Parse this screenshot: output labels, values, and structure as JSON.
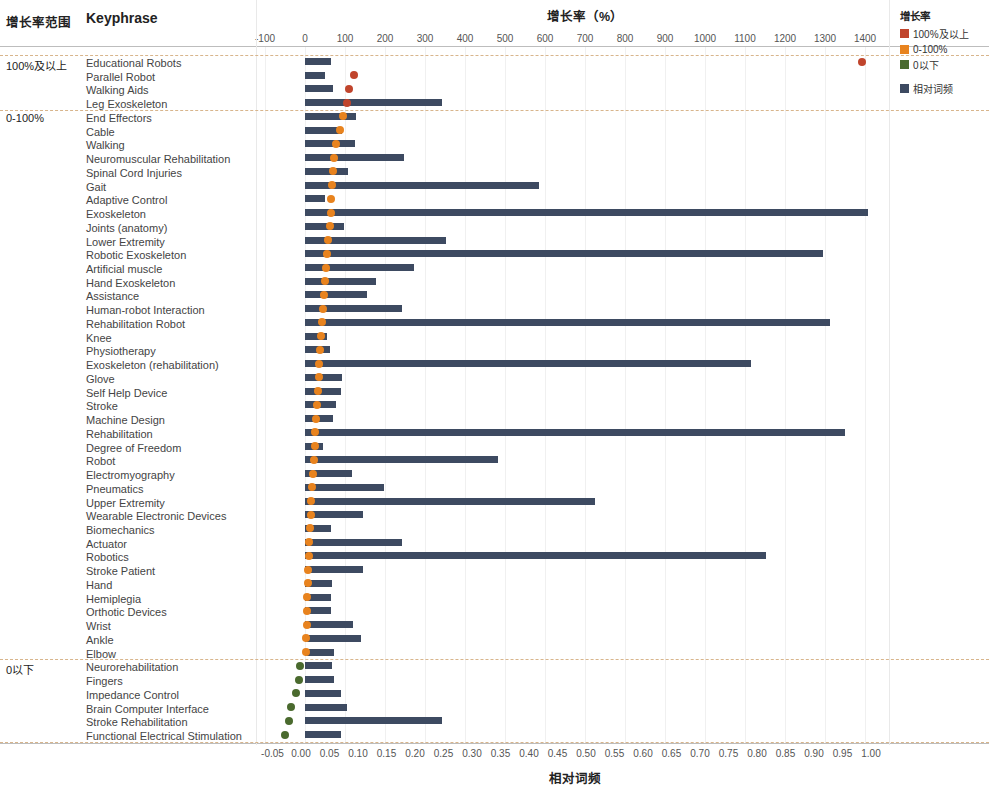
{
  "headers": {
    "range_column": "增长率范围",
    "keyphrase_column": "Keyphrase",
    "growth_axis_title": "增长率（%）",
    "freq_axis_title": "相对词频"
  },
  "legend": {
    "title": "增长率",
    "items": [
      {
        "label": "100%及以上",
        "color": "#C0442C"
      },
      {
        "label": "0-100%",
        "color": "#E8831E"
      },
      {
        "label": "0以下",
        "color": "#4A6A2E"
      }
    ],
    "bar_item": {
      "label": "相对词频",
      "color": "#3D4A61"
    }
  },
  "chart_data": {
    "type": "bar",
    "title": "增长率（%）",
    "xlabel": "增长率（%）",
    "ylabel": "Keyphrase",
    "secondary_xlabel": "相对词频",
    "grid": true,
    "legend_position": "top-right",
    "top_axis": {
      "label": "增长率（%）",
      "ticks": [
        -100,
        0,
        100,
        200,
        300,
        400,
        500,
        600,
        700,
        800,
        900,
        1000,
        1100,
        1200,
        1300,
        1400
      ],
      "range": [
        -100,
        1400
      ]
    },
    "bottom_axis": {
      "label": "相对词频",
      "ticks": [
        "-0.05",
        "0.00",
        "0.05",
        "0.10",
        "0.15",
        "0.20",
        "0.25",
        "0.30",
        "0.35",
        "0.40",
        "0.45",
        "0.50",
        "0.55",
        "0.60",
        "0.65",
        "0.70",
        "0.75",
        "0.80",
        "0.85",
        "0.90",
        "0.95",
        "1.00"
      ],
      "range": [
        -0.05,
        1.0
      ]
    },
    "groups": [
      {
        "label": "100%及以上",
        "start_index": 0,
        "count": 4
      },
      {
        "label": "0-100%",
        "start_index": 4,
        "count": 40
      },
      {
        "label": "0以下",
        "start_index": 44,
        "count": 6
      }
    ],
    "series": [
      {
        "name": "相对词频",
        "type": "bar",
        "color": "#3D4A61"
      },
      {
        "name": "增长率",
        "type": "scatter"
      }
    ],
    "categories": [
      "Educational Robots",
      "Parallel Robot",
      "Walking Aids",
      "Leg Exoskeleton",
      "End Effectors",
      "Cable",
      "Walking",
      "Neuromuscular Rehabilitation",
      "Spinal Cord Injuries",
      "Gait",
      "Adaptive Control",
      "Exoskeleton",
      "Joints (anatomy)",
      "Lower Extremity",
      "Robotic Exoskeleton",
      "Artificial muscle",
      "Hand Exoskeleton",
      "Assistance",
      "Human-robot Interaction",
      "Rehabilitation Robot",
      "Knee",
      "Physiotherapy",
      "Exoskeleton (rehabilitation)",
      "Glove",
      "Self Help Device",
      "Stroke",
      "Machine Design",
      "Rehabilitation",
      "Degree of Freedom",
      "Robot",
      "Electromyography",
      "Pneumatics",
      "Upper Extremity",
      "Wearable Electronic Devices",
      "Biomechanics",
      "Actuator",
      "Robotics",
      "Stroke Patient",
      "Hand",
      "Hemiplegia",
      "Orthotic Devices",
      "Wrist",
      "Ankle",
      "Elbow",
      "Neurorehabilitation",
      "Fingers",
      "Impedance Control",
      "Brain Computer Interface",
      "Stroke Rehabilitation",
      "Functional Electrical Stimulation"
    ],
    "rows": [
      {
        "keyphrase": "Educational Robots",
        "group": "100%及以上",
        "freq": 0.052,
        "growth": 1393,
        "dot_color": "#C0442C"
      },
      {
        "keyphrase": "Parallel Robot",
        "group": "100%及以上",
        "freq": 0.042,
        "growth": 123,
        "dot_color": "#C0442C"
      },
      {
        "keyphrase": "Walking Aids",
        "group": "100%及以上",
        "freq": 0.056,
        "growth": 111,
        "dot_color": "#C0442C"
      },
      {
        "keyphrase": "Leg Exoskeleton",
        "group": "100%及以上",
        "freq": 0.247,
        "growth": 106,
        "dot_color": "#C0442C"
      },
      {
        "keyphrase": "End Effectors",
        "group": "0-100%",
        "freq": 0.097,
        "growth": 95,
        "dot_color": "#E8831E"
      },
      {
        "keyphrase": "Cable",
        "group": "0-100%",
        "freq": 0.072,
        "growth": 87,
        "dot_color": "#E8831E"
      },
      {
        "keyphrase": "Walking",
        "group": "0-100%",
        "freq": 0.095,
        "growth": 78,
        "dot_color": "#E8831E"
      },
      {
        "keyphrase": "Neuromuscular Rehabilitation",
        "group": "0-100%",
        "freq": 0.18,
        "growth": 73,
        "dot_color": "#E8831E"
      },
      {
        "keyphrase": "Spinal Cord Injuries",
        "group": "0-100%",
        "freq": 0.082,
        "growth": 70,
        "dot_color": "#E8831E"
      },
      {
        "keyphrase": "Gait",
        "group": "0-100%",
        "freq": 0.418,
        "growth": 68,
        "dot_color": "#E8831E"
      },
      {
        "keyphrase": "Adaptive Control",
        "group": "0-100%",
        "freq": 0.042,
        "growth": 66,
        "dot_color": "#E8831E"
      },
      {
        "keyphrase": "Exoskeleton",
        "group": "0-100%",
        "freq": 0.995,
        "growth": 64,
        "dot_color": "#E8831E"
      },
      {
        "keyphrase": "Joints (anatomy)",
        "group": "0-100%",
        "freq": 0.075,
        "growth": 62,
        "dot_color": "#E8831E"
      },
      {
        "keyphrase": "Lower Extremity",
        "group": "0-100%",
        "freq": 0.255,
        "growth": 58,
        "dot_color": "#E8831E"
      },
      {
        "keyphrase": "Robotic Exoskeleton",
        "group": "0-100%",
        "freq": 0.915,
        "growth": 56,
        "dot_color": "#E8831E"
      },
      {
        "keyphrase": "Artificial muscle",
        "group": "0-100%",
        "freq": 0.198,
        "growth": 53,
        "dot_color": "#E8831E"
      },
      {
        "keyphrase": "Hand Exoskeleton",
        "group": "0-100%",
        "freq": 0.132,
        "growth": 50,
        "dot_color": "#E8831E"
      },
      {
        "keyphrase": "Assistance",
        "group": "0-100%",
        "freq": 0.116,
        "growth": 47,
        "dot_color": "#E8831E"
      },
      {
        "keyphrase": "Human-robot Interaction",
        "group": "0-100%",
        "freq": 0.177,
        "growth": 44,
        "dot_color": "#E8831E"
      },
      {
        "keyphrase": "Rehabilitation Robot",
        "group": "0-100%",
        "freq": 0.928,
        "growth": 42,
        "dot_color": "#E8831E"
      },
      {
        "keyphrase": "Knee",
        "group": "0-100%",
        "freq": 0.045,
        "growth": 40,
        "dot_color": "#E8831E"
      },
      {
        "keyphrase": "Physiotherapy",
        "group": "0-100%",
        "freq": 0.05,
        "growth": 38,
        "dot_color": "#E8831E"
      },
      {
        "keyphrase": "Exoskeleton (rehabilitation)",
        "group": "0-100%",
        "freq": 0.79,
        "growth": 36,
        "dot_color": "#E8831E"
      },
      {
        "keyphrase": "Glove",
        "group": "0-100%",
        "freq": 0.072,
        "growth": 34,
        "dot_color": "#E8831E"
      },
      {
        "keyphrase": "Self Help Device",
        "group": "0-100%",
        "freq": 0.07,
        "growth": 32,
        "dot_color": "#E8831E"
      },
      {
        "keyphrase": "Stroke",
        "group": "0-100%",
        "freq": 0.061,
        "growth": 30,
        "dot_color": "#E8831E"
      },
      {
        "keyphrase": "Machine Design",
        "group": "0-100%",
        "freq": 0.057,
        "growth": 28,
        "dot_color": "#E8831E"
      },
      {
        "keyphrase": "Rehabilitation",
        "group": "0-100%",
        "freq": 0.955,
        "growth": 26,
        "dot_color": "#E8831E"
      },
      {
        "keyphrase": "Degree of Freedom",
        "group": "0-100%",
        "freq": 0.038,
        "growth": 24,
        "dot_color": "#E8831E"
      },
      {
        "keyphrase": "Robot",
        "group": "0-100%",
        "freq": 0.345,
        "growth": 22,
        "dot_color": "#E8831E"
      },
      {
        "keyphrase": "Electromyography",
        "group": "0-100%",
        "freq": 0.09,
        "growth": 20,
        "dot_color": "#E8831E"
      },
      {
        "keyphrase": "Pneumatics",
        "group": "0-100%",
        "freq": 0.145,
        "growth": 18,
        "dot_color": "#E8831E"
      },
      {
        "keyphrase": "Upper Extremity",
        "group": "0-100%",
        "freq": 0.515,
        "growth": 16,
        "dot_color": "#E8831E"
      },
      {
        "keyphrase": "Wearable Electronic Devices",
        "group": "0-100%",
        "freq": 0.108,
        "growth": 14,
        "dot_color": "#E8831E"
      },
      {
        "keyphrase": "Biomechanics",
        "group": "0-100%",
        "freq": 0.052,
        "growth": 12,
        "dot_color": "#E8831E"
      },
      {
        "keyphrase": "Actuator",
        "group": "0-100%",
        "freq": 0.178,
        "growth": 10,
        "dot_color": "#E8831E"
      },
      {
        "keyphrase": "Robotics",
        "group": "0-100%",
        "freq": 0.815,
        "growth": 9,
        "dot_color": "#E8831E"
      },
      {
        "keyphrase": "Stroke Patient",
        "group": "0-100%",
        "freq": 0.108,
        "growth": 8,
        "dot_color": "#E8831E"
      },
      {
        "keyphrase": "Hand",
        "group": "0-100%",
        "freq": 0.055,
        "growth": 7,
        "dot_color": "#E8831E"
      },
      {
        "keyphrase": "Hemiplegia",
        "group": "0-100%",
        "freq": 0.052,
        "growth": 6,
        "dot_color": "#E8831E"
      },
      {
        "keyphrase": "Orthotic Devices",
        "group": "0-100%",
        "freq": 0.053,
        "growth": 5,
        "dot_color": "#E8831E"
      },
      {
        "keyphrase": "Wrist",
        "group": "0-100%",
        "freq": 0.092,
        "growth": 4,
        "dot_color": "#E8831E"
      },
      {
        "keyphrase": "Ankle",
        "group": "0-100%",
        "freq": 0.105,
        "growth": 3,
        "dot_color": "#E8831E"
      },
      {
        "keyphrase": "Elbow",
        "group": "0-100%",
        "freq": 0.058,
        "growth": 2,
        "dot_color": "#E8831E"
      },
      {
        "keyphrase": "Neurorehabilitation",
        "group": "0以下",
        "freq": 0.055,
        "growth": -12,
        "dot_color": "#4A6A2E"
      },
      {
        "keyphrase": "Fingers",
        "group": "0以下",
        "freq": 0.058,
        "growth": -15,
        "dot_color": "#4A6A2E"
      },
      {
        "keyphrase": "Impedance Control",
        "group": "0以下",
        "freq": 0.07,
        "growth": -22,
        "dot_color": "#4A6A2E"
      },
      {
        "keyphrase": "Brain Computer Interface",
        "group": "0以下",
        "freq": 0.08,
        "growth": -35,
        "dot_color": "#4A6A2E"
      },
      {
        "keyphrase": "Stroke Rehabilitation",
        "group": "0以下",
        "freq": 0.248,
        "growth": -40,
        "dot_color": "#4A6A2E"
      },
      {
        "keyphrase": "Functional Electrical Stimulation",
        "group": "0以下",
        "freq": 0.07,
        "growth": -50,
        "dot_color": "#4A6A2E"
      }
    ]
  }
}
